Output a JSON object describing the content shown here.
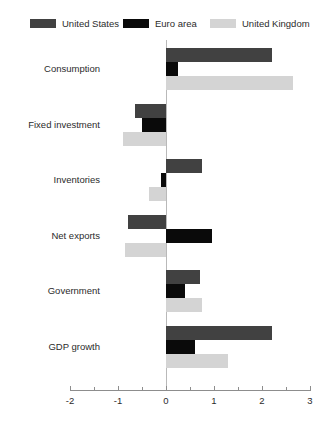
{
  "chart_data": {
    "type": "bar",
    "orientation": "horizontal",
    "title": "",
    "xlabel": "",
    "ylabel": "",
    "xlim": [
      -2,
      3
    ],
    "xticks": [
      -2,
      -1,
      0,
      1,
      2,
      3
    ],
    "xtick_labels": [
      "-2",
      "-1",
      "0",
      "1",
      "2",
      "3"
    ],
    "xminor_ticks": [
      -1.5,
      -0.5,
      0.5,
      1.5,
      2.5
    ],
    "grid": false,
    "legend_position": "top",
    "categories": [
      "Consumption",
      "Fixed investment",
      "Inventories",
      "Net exports",
      "Government",
      "GDP growth"
    ],
    "series": [
      {
        "name": "United States",
        "color": "#414141",
        "values": [
          2.2,
          -0.65,
          0.75,
          -0.8,
          0.7,
          2.2
        ]
      },
      {
        "name": "Euro area",
        "color": "#0a0a0a",
        "values": [
          0.25,
          -0.5,
          -0.1,
          0.95,
          0.4,
          0.6
        ]
      },
      {
        "name": "United Kingdom",
        "color": "#d4d4d4",
        "values": [
          2.65,
          -0.9,
          -0.35,
          -0.85,
          0.75,
          1.3
        ]
      }
    ]
  },
  "legend": {
    "items": [
      {
        "label": "United States",
        "color": "#414141"
      },
      {
        "label": "Euro area",
        "color": "#0a0a0a"
      },
      {
        "label": "United Kingdom",
        "color": "#d4d4d4"
      }
    ]
  },
  "axis": {
    "zero_line_color": "#b9b9b9",
    "axis_line_color": "#8d8d8d"
  }
}
